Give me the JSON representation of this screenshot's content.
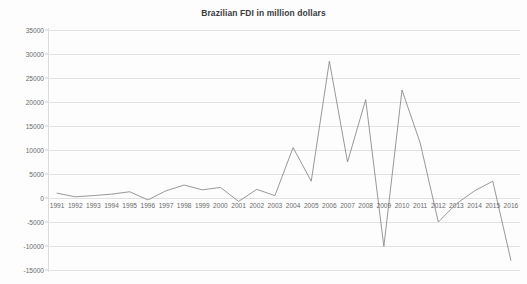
{
  "chart_data": {
    "type": "line",
    "title": "Brazilian FDI in million dollars",
    "xlabel": "",
    "ylabel": "",
    "grid": true,
    "legend": "none",
    "ylim": [
      -15000,
      35000
    ],
    "ytick_step": 5000,
    "yticks": [
      35000,
      30000,
      25000,
      20000,
      15000,
      10000,
      5000,
      0,
      -5000,
      -10000,
      -15000
    ],
    "ytick_labels": [
      "35000",
      "30000",
      "25000",
      "20000",
      "15000",
      "10000",
      "5000",
      "0",
      "-5000",
      "-10000",
      "-15000"
    ],
    "categories": [
      "1991",
      "1992",
      "1993",
      "1994",
      "1995",
      "1996",
      "1997",
      "1998",
      "1999",
      "2000",
      "2001",
      "2002",
      "2003",
      "2004",
      "2005",
      "2006",
      "2007",
      "2008",
      "2009",
      "2010",
      "2011",
      "2012",
      "2013",
      "2014",
      "2015",
      "2016"
    ],
    "x": [
      1991,
      1992,
      1993,
      1994,
      1995,
      1996,
      1997,
      1998,
      1999,
      2000,
      2001,
      2002,
      2003,
      2004,
      2005,
      2006,
      2007,
      2008,
      2009,
      2010,
      2011,
      2012,
      2013,
      2014,
      2015,
      2016
    ],
    "values": [
      1000,
      250,
      500,
      800,
      1300,
      -400,
      1500,
      2700,
      1700,
      2200,
      -700,
      1800,
      500,
      10500,
      3500,
      28500,
      7500,
      20500,
      -10100,
      22500,
      11500,
      -5000,
      -1200,
      1500,
      3500,
      -13000
    ],
    "series": [
      {
        "name": "Brazilian FDI",
        "color": "#8c8c8e",
        "values": [
          1000,
          250,
          500,
          800,
          1300,
          -400,
          1500,
          2700,
          1700,
          2200,
          -700,
          1800,
          500,
          10500,
          3500,
          28500,
          7500,
          20500,
          -10100,
          22500,
          11500,
          -5000,
          -1200,
          1500,
          3500,
          -13000
        ]
      }
    ]
  },
  "colors": {
    "line": "#8c8c8e",
    "grid": "#e2e2e4",
    "axis": "#dcdcde",
    "text": "#6a6a6c",
    "title": "#3b3b3d",
    "background": "#fdfdfd"
  }
}
